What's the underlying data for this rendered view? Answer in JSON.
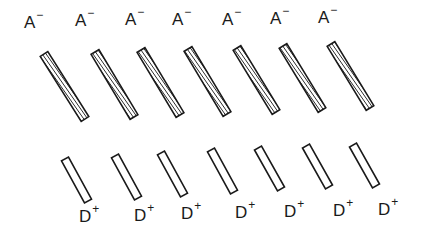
{
  "figure": {
    "acceptor": {
      "label_base": "A",
      "label_charge": "−",
      "fill": "hatched",
      "count": 7
    },
    "donor": {
      "label_base": "D",
      "label_charge": "+",
      "fill": "open",
      "count": 7
    },
    "stroke_color": "#1a1a1a",
    "background": "#ffffff"
  },
  "acceptors": [
    {
      "label_x": 24,
      "label_y": 14,
      "x1": 44,
      "y1": 54,
      "x2": 85,
      "y2": 119
    },
    {
      "label_x": 75,
      "label_y": 12,
      "x1": 95,
      "y1": 52,
      "x2": 134,
      "y2": 117
    },
    {
      "label_x": 125,
      "label_y": 11,
      "x1": 141,
      "y1": 50,
      "x2": 180,
      "y2": 115
    },
    {
      "label_x": 172,
      "label_y": 11,
      "x1": 188,
      "y1": 49,
      "x2": 227,
      "y2": 114
    },
    {
      "label_x": 222,
      "label_y": 11,
      "x1": 237,
      "y1": 48,
      "x2": 276,
      "y2": 112
    },
    {
      "label_x": 270,
      "label_y": 10,
      "x1": 283,
      "y1": 46,
      "x2": 322,
      "y2": 110
    },
    {
      "label_x": 318,
      "label_y": 9,
      "x1": 331,
      "y1": 44,
      "x2": 370,
      "y2": 108
    }
  ],
  "donors": [
    {
      "label_x": 79,
      "label_y": 208,
      "x1": 65,
      "y1": 159,
      "x2": 88,
      "y2": 201
    },
    {
      "label_x": 134,
      "label_y": 207,
      "x1": 115,
      "y1": 156,
      "x2": 138,
      "y2": 198
    },
    {
      "label_x": 181,
      "label_y": 205,
      "x1": 161,
      "y1": 153,
      "x2": 184,
      "y2": 195
    },
    {
      "label_x": 235,
      "label_y": 204,
      "x1": 211,
      "y1": 150,
      "x2": 234,
      "y2": 192
    },
    {
      "label_x": 284,
      "label_y": 203,
      "x1": 258,
      "y1": 148,
      "x2": 281,
      "y2": 189
    },
    {
      "label_x": 333,
      "label_y": 202,
      "x1": 306,
      "y1": 146,
      "x2": 329,
      "y2": 187
    },
    {
      "label_x": 378,
      "label_y": 201,
      "x1": 353,
      "y1": 145,
      "x2": 376,
      "y2": 186
    }
  ]
}
